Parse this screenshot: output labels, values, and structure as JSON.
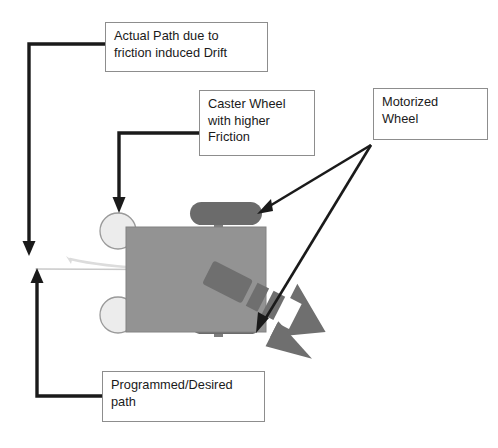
{
  "diagram": {
    "colors": {
      "body_fill": "#939393",
      "body_stroke": "#6f6f6f",
      "motor_wheel_fill": "#6b6b6b",
      "caster_fill": "#ececec",
      "caster_stroke": "#9a9a9a",
      "connector": "#1a1a1a",
      "callout_border": "#8d8d8d",
      "drift_path": "#d5d5d5",
      "desired_path": "#c9c9c9",
      "direction_arrow": "#6f6f6f"
    },
    "callouts": [
      {
        "id": "actual-path",
        "text": "Actual Path due to\nfriction induced Drift"
      },
      {
        "id": "caster",
        "text": "Caster Wheel\nwith higher\nFriction"
      },
      {
        "id": "motorized",
        "text": "Motorized\nWheel"
      },
      {
        "id": "programmed",
        "text": "Programmed/Desired\npath"
      }
    ],
    "parts": {
      "chassis_label": "robot-chassis",
      "motor_wheel_top_label": "motorized-wheel-top",
      "motor_wheel_bottom_label": "motorized-wheel-bottom",
      "caster_top_label": "caster-wheel-top",
      "caster_bottom_label": "caster-wheel-bottom",
      "direction_arrow_label": "striped-direction-arrow"
    }
  }
}
